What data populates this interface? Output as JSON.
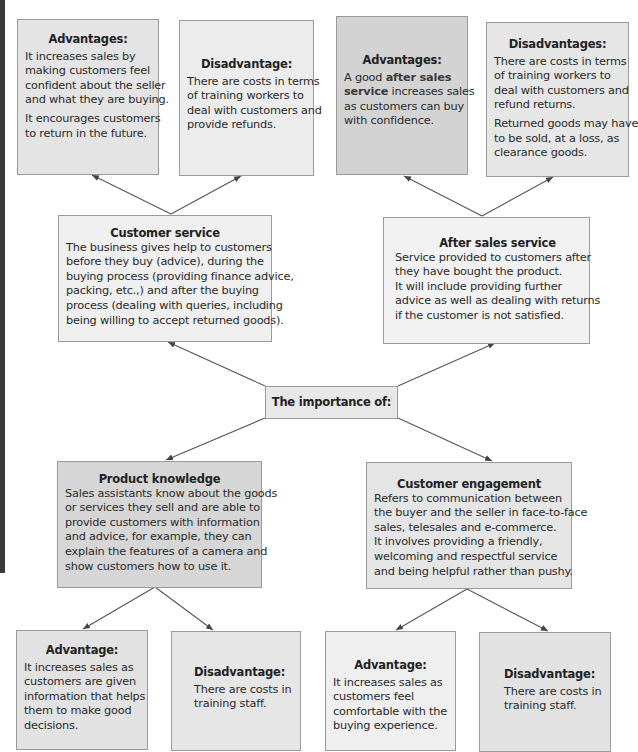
{
  "diagram": {
    "center": {
      "title": "The importance of:"
    },
    "nodes": {
      "customer_service": {
        "title": "Customer service",
        "lines": [
          "The business gives help to customers",
          "before they buy (advice), during the",
          "buying process (providing finance advice,",
          "packing, etc.,) and after the buying",
          "process (dealing with queries, including",
          "being willing to accept returned goods)."
        ],
        "advantage": {
          "title": "Advantages:",
          "paragraphs": [
            [
              "It increases sales by",
              "making customers feel",
              "confident about the seller",
              "and what they are buying."
            ],
            [
              "It encourages customers",
              "to return in the future."
            ]
          ]
        },
        "disadvantage": {
          "title": "Disadvantage:",
          "paragraphs": [
            [
              "There are costs in terms",
              "of training workers to",
              "deal with customers and",
              "provide refunds."
            ]
          ]
        }
      },
      "after_sales_service": {
        "title": "After sales service",
        "lines": [
          "Service provided to customers after",
          "they have bought the product.",
          "It will include providing further",
          "advice as well as dealing with returns",
          "if the customer is not satisfied."
        ],
        "advantage": {
          "title": "Advantages:",
          "line1_prefix": "A good ",
          "line1_bold": "after sales",
          "line2_bold": "service",
          "line2_rest": " increases sales",
          "line3": "as customers can buy",
          "line4": "with confidence."
        },
        "disadvantage": {
          "title": "Disadvantages:",
          "paragraphs": [
            [
              "There are costs in terms",
              "of training workers to",
              "deal with customers and",
              "refund returns."
            ],
            [
              "Returned goods may have",
              "to be sold, at a loss, as",
              "clearance goods."
            ]
          ]
        }
      },
      "product_knowledge": {
        "title": "Product knowledge",
        "lines": [
          "Sales assistants know about the goods",
          "or services they sell and are able to",
          "provide customers with information",
          "and advice, for example, they can",
          "explain the features of a camera and",
          "show customers how to use it."
        ],
        "advantage": {
          "title": "Advantage:",
          "paragraphs": [
            [
              "It increases sales as",
              "customers are given",
              "information that helps",
              "them to make good",
              "decisions."
            ]
          ]
        },
        "disadvantage": {
          "title": "Disadvantage:",
          "paragraphs": [
            [
              "There are costs in",
              "training staff."
            ]
          ]
        }
      },
      "customer_engagement": {
        "title": "Customer engagement",
        "lines": [
          "Refers to communication between",
          "the buyer and the seller in face-to-face",
          "sales, telesales and e-commerce.",
          "It involves providing a friendly,",
          "welcoming and respectful service",
          "and being helpful rather than pushy."
        ],
        "advantage": {
          "title": "Advantage:",
          "paragraphs": [
            [
              "It increases sales as",
              "customers feel",
              "comfortable with the",
              "buying experience."
            ]
          ]
        },
        "disadvantage": {
          "title": "Disadvantage:",
          "paragraphs": [
            [
              "There are costs in",
              "training staff."
            ]
          ]
        }
      }
    },
    "colors": {
      "edge_strip": "#3a3a3a",
      "border": "#9a9a9a",
      "arrow": "#555555",
      "box_light": "#efefef",
      "box_mid": "#e4e4e4",
      "box_dark": "#d3d3d3"
    }
  }
}
